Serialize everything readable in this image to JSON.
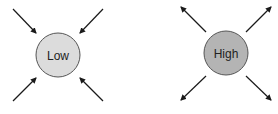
{
  "diagram": {
    "nodes": [
      {
        "id": "low",
        "label": "Low",
        "fill": "#dcdcdc",
        "stroke": "#555555",
        "cx": 58,
        "cy": 55,
        "r": 22,
        "arrow_direction": "inward"
      },
      {
        "id": "high",
        "label": "High",
        "fill": "#b4b4b4",
        "stroke": "#555555",
        "cx": 226,
        "cy": 53,
        "r": 22,
        "arrow_direction": "outward"
      }
    ],
    "arrow_color": "#1a1a1a"
  }
}
